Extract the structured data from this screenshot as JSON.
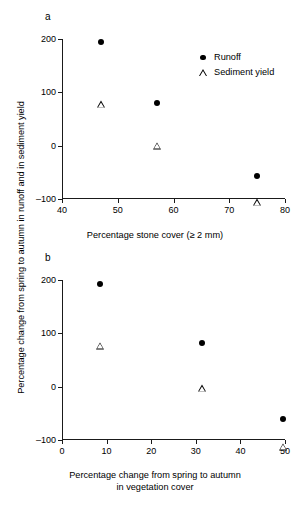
{
  "figure": {
    "shared_ylabel": "Percentage change from spring to autumn in runoff and in sediment yield",
    "legend": {
      "position": "upper-right-panel-a",
      "entries": [
        {
          "symbol": "filled-circle",
          "label": "Runoff"
        },
        {
          "symbol": "open-triangle",
          "label": "Sediment yield"
        }
      ]
    }
  },
  "chart_data": [
    {
      "type": "scatter",
      "panel": "a",
      "title": "a",
      "xlabel": "Percentage stone cover (≥ 2 mm)",
      "ylabel": "Percentage change from spring to autumn in runoff and in sediment yield",
      "xlim": [
        40,
        80
      ],
      "ylim": [
        -100,
        200
      ],
      "xticks": [
        40,
        50,
        60,
        70,
        80
      ],
      "yticks": [
        -100,
        0,
        100,
        200
      ],
      "xtick_labels": [
        "40",
        "50",
        "60",
        "70",
        "80"
      ],
      "ytick_labels": [
        "-100",
        "0",
        "100",
        "200"
      ],
      "grid": false,
      "series": [
        {
          "name": "Runoff",
          "marker": "filled-circle",
          "points": [
            {
              "x": 47,
              "y": 195
            },
            {
              "x": 57,
              "y": 80
            },
            {
              "x": 75,
              "y": -57
            }
          ]
        },
        {
          "name": "Sediment yield",
          "marker": "open-triangle",
          "points": [
            {
              "x": 47,
              "y": 78
            },
            {
              "x": 57,
              "y": 13
            },
            {
              "x": 75,
              "y": -80
            }
          ]
        }
      ]
    },
    {
      "type": "scatter",
      "panel": "b",
      "title": "b",
      "xlabel": "Percentage change from spring to autumn in vegetation cover",
      "xlabel_line1": "Percentage change from spring to autumn",
      "xlabel_line2": "in vegetation cover",
      "ylabel": "Percentage change from spring to autumn in runoff and in sediment yield",
      "xlim": [
        0,
        50
      ],
      "ylim": [
        -100,
        200
      ],
      "xticks": [
        0,
        10,
        20,
        30,
        40,
        50
      ],
      "yticks": [
        -100,
        0,
        100,
        200
      ],
      "xtick_labels": [
        "0",
        "10",
        "20",
        "30",
        "40",
        "50"
      ],
      "ytick_labels": [
        "-100",
        "0",
        "100",
        "200"
      ],
      "grid": false,
      "series": [
        {
          "name": "Runoff",
          "marker": "filled-circle",
          "points": [
            {
              "x": 8.5,
              "y": 193
            },
            {
              "x": 31.5,
              "y": 81
            },
            {
              "x": 49.5,
              "y": -60
            }
          ]
        },
        {
          "name": "Sediment yield",
          "marker": "open-triangle",
          "points": [
            {
              "x": 8.5,
              "y": 77
            },
            {
              "x": 31.5,
              "y": 10
            },
            {
              "x": 49.5,
              "y": -86
            }
          ]
        }
      ]
    }
  ]
}
